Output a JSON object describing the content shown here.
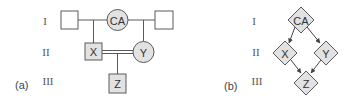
{
  "colors": {
    "stroke": "#5a5a5a",
    "fill": "#e2e2e2",
    "empty": "#ffffff"
  },
  "panel_a": {
    "label": "(a)",
    "generations": [
      "I",
      "II",
      "III"
    ],
    "nodes": {
      "left_parent": "",
      "ca": "CA",
      "right_parent": "",
      "x": "X",
      "y": "Y",
      "z": "Z"
    }
  },
  "panel_b": {
    "label": "(b)",
    "generations": [
      "I",
      "II",
      "III"
    ],
    "nodes": {
      "ca": "CA",
      "x": "X",
      "y": "Y",
      "z": "Z"
    },
    "edges": [
      {
        "from": "CA",
        "to": "X"
      },
      {
        "from": "CA",
        "to": "Y"
      },
      {
        "from": "X",
        "to": "Z"
      },
      {
        "from": "Y",
        "to": "Z"
      }
    ]
  }
}
